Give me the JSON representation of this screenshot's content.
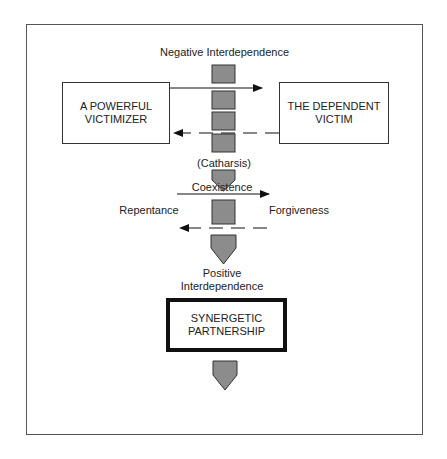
{
  "diagram": {
    "top_label": "Negative Interdependence",
    "left_box": {
      "line1": "A POWERFUL",
      "line2": "VICTIMIZER"
    },
    "right_box": {
      "line1": "THE DEPENDENT",
      "line2": "VICTIM"
    },
    "catharsis_label": "(Catharsis)",
    "repentance_label": "Repentance",
    "forgiveness_label": "Forgiveness",
    "positive_label": {
      "line1": "Positive",
      "line2": "Interdependence"
    },
    "center_box": {
      "line1": "SYNERGETIC",
      "line2": "PARTNERSHIP"
    },
    "bottom_label": "Coexistence",
    "colors": {
      "block_fill": "#8c8c8c",
      "stroke": "#111111",
      "frame": "#555555"
    }
  }
}
